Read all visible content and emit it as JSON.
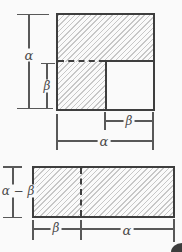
{
  "diagram": {
    "top_figure": {
      "height_label": "α",
      "inner_height_label": "β",
      "inner_width_label": "β",
      "width_label": "α"
    },
    "bottom_figure": {
      "height_label": "α − β",
      "left_width_label": "β",
      "right_width_label": "α"
    }
  },
  "colors": {
    "figure_line": "#3e3e3e",
    "dimension_line": "#585858",
    "hatch_line": "#c7c7c7",
    "background": "#fafafa"
  }
}
